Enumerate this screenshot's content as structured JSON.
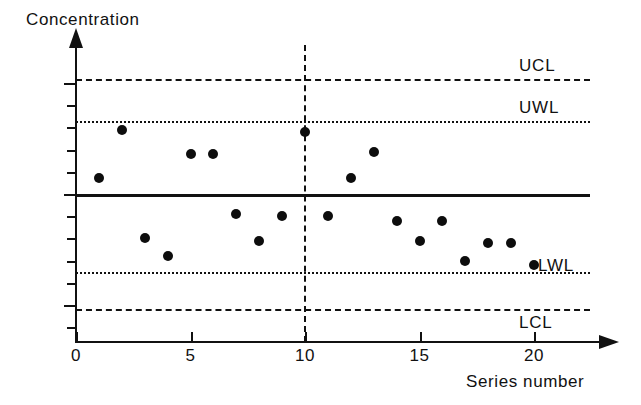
{
  "chart_data": {
    "type": "scatter",
    "title": "",
    "ylabel": "Concentration",
    "xlabel": "Series number",
    "xlim": [
      0,
      22
    ],
    "ylim": [
      -0.65,
      0.65
    ],
    "grid": false,
    "legend_position": "inline-right",
    "x": [
      1,
      2,
      3,
      4,
      5,
      6,
      7,
      8,
      9,
      10,
      11,
      12,
      13,
      14,
      15,
      16,
      17,
      18,
      19,
      20
    ],
    "values": [
      0.07,
      0.29,
      -0.2,
      -0.28,
      0.18,
      0.18,
      -0.09,
      -0.21,
      -0.1,
      0.28,
      -0.1,
      0.07,
      0.19,
      -0.12,
      -0.21,
      -0.12,
      -0.3,
      -0.22,
      -0.22,
      -0.32
    ],
    "series": [
      {
        "name": "Concentration",
        "values": [
          0.07,
          0.29,
          -0.2,
          -0.28,
          0.18,
          0.18,
          -0.09,
          -0.21,
          -0.1,
          0.28,
          -0.1,
          0.07,
          0.19,
          -0.12,
          -0.21,
          -0.12,
          -0.3,
          -0.22,
          -0.22,
          -0.32
        ]
      }
    ],
    "reference_lines": [
      {
        "label": "UCL",
        "value": 0.52,
        "style": "dashed"
      },
      {
        "label": "UWL",
        "value": 0.33,
        "style": "dotted"
      },
      {
        "label": "CL",
        "value": 0.0,
        "style": "solid"
      },
      {
        "label": "LWL",
        "value": -0.35,
        "style": "dotted"
      },
      {
        "label": "LCL",
        "value": -0.52,
        "style": "dashed"
      }
    ],
    "divider": {
      "value": 10,
      "style": "dashed"
    },
    "y_ticks": [
      {
        "value": 0.5,
        "label": "+ 0.5",
        "major": true
      },
      {
        "value": 0.4,
        "label": "",
        "major": false
      },
      {
        "value": 0.3,
        "label": "",
        "major": false
      },
      {
        "value": 0.2,
        "label": "",
        "major": false
      },
      {
        "value": 0.1,
        "label": "",
        "major": false
      },
      {
        "value": 0.0,
        "label": "0",
        "major": true
      },
      {
        "value": -0.1,
        "label": "",
        "major": false
      },
      {
        "value": -0.2,
        "label": "",
        "major": false
      },
      {
        "value": -0.3,
        "label": "",
        "major": false
      },
      {
        "value": -0.4,
        "label": "",
        "major": false
      },
      {
        "value": -0.5,
        "label": "- 0.5",
        "major": true
      },
      {
        "value": -0.6,
        "label": "",
        "major": false
      }
    ],
    "x_ticks": [
      {
        "value": 0,
        "label": "0"
      },
      {
        "value": 5,
        "label": "5"
      },
      {
        "value": 10,
        "label": "10"
      },
      {
        "value": 15,
        "label": "15"
      },
      {
        "value": 20,
        "label": "20"
      }
    ]
  },
  "axes": {
    "y_title": "Concentration",
    "x_title": "Series number"
  }
}
